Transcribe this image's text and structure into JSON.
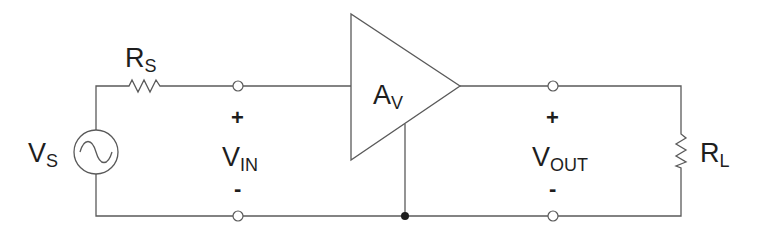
{
  "diagram": {
    "components": {
      "source": {
        "symbol": "V",
        "subscript": "S",
        "type": "ac-voltage-source"
      },
      "source_resistor": {
        "symbol": "R",
        "subscript": "S",
        "type": "resistor"
      },
      "amplifier": {
        "symbol": "A",
        "subscript": "V",
        "type": "amplifier"
      },
      "load_resistor": {
        "symbol": "R",
        "subscript": "L",
        "type": "resistor"
      }
    },
    "ports": {
      "input": {
        "symbol": "V",
        "subscript": "IN",
        "plus": "+",
        "minus": "-"
      },
      "output": {
        "symbol": "V",
        "subscript": "OUT",
        "plus": "+",
        "minus": "-"
      }
    },
    "colors": {
      "wire": "#5a5a5a",
      "text": "#1e1e1e",
      "background": "#ffffff"
    }
  }
}
